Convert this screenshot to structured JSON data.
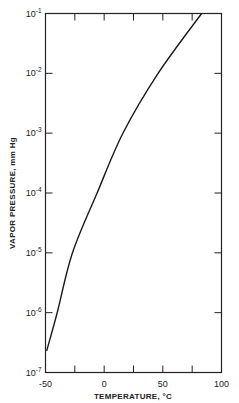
{
  "chart_data": {
    "type": "line",
    "title": "",
    "xlabel": "TEMPERATURE, °C",
    "ylabel": "VAPOR PRESSURE, mm Hg",
    "xlim": [
      -50,
      100
    ],
    "ylim": [
      1e-07,
      0.1
    ],
    "yscale": "log",
    "grid": false,
    "legend": null,
    "x_ticks": [
      -50,
      0,
      50,
      100
    ],
    "x_tick_labels": [
      "-50",
      "0",
      "50",
      "100"
    ],
    "x_minor_ticks": [
      -25,
      25,
      75
    ],
    "y_ticks": [
      1e-07,
      1e-06,
      1e-05,
      0.0001,
      0.001,
      0.01,
      0.1
    ],
    "y_tick_labels": [
      {
        "base": "10",
        "exp": "-7"
      },
      {
        "base": "10",
        "exp": "-6"
      },
      {
        "base": "10",
        "exp": "-5"
      },
      {
        "base": "10",
        "exp": "-4"
      },
      {
        "base": "10",
        "exp": "-3"
      },
      {
        "base": "10",
        "exp": "-2"
      },
      {
        "base": "10",
        "exp": "-1"
      }
    ],
    "series": [
      {
        "name": "vapor pressure",
        "x": [
          -49,
          -40,
          -27,
          -6,
          16,
          46,
          83
        ],
        "y": [
          2.3e-07,
          1e-06,
          1e-05,
          0.0001,
          0.001,
          0.01,
          0.1
        ]
      }
    ]
  }
}
